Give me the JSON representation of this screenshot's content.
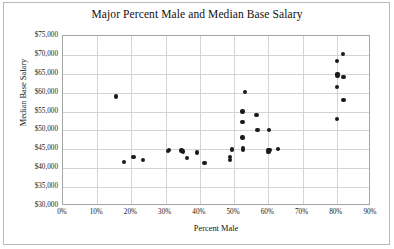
{
  "chart_data": {
    "type": "scatter",
    "title": "Major Percent Male and Median Base Salary",
    "xlabel": "Percent Male",
    "ylabel": "Median Base Salary",
    "xlim": [
      0,
      90
    ],
    "ylim": [
      30000,
      75000
    ],
    "xticks": [
      "0%",
      "10%",
      "20%",
      "30%",
      "40%",
      "50%",
      "60%",
      "70%",
      "80%",
      "90%"
    ],
    "xtick_values": [
      0,
      10,
      20,
      30,
      40,
      50,
      60,
      70,
      80,
      90
    ],
    "yticks": [
      "$30,000",
      "$35,000",
      "$40,000",
      "$45,000",
      "$50,000",
      "$55,000",
      "$60,000",
      "$65,000",
      "$70,000",
      "$75,000"
    ],
    "ytick_values": [
      30000,
      35000,
      40000,
      45000,
      50000,
      55000,
      60000,
      65000,
      70000,
      75000
    ],
    "grid": true,
    "legend": false,
    "marker_color": "#1a1a1a",
    "points": [
      {
        "x": 15.5,
        "y": 59000
      },
      {
        "x": 17.8,
        "y": 41700
      },
      {
        "x": 20.6,
        "y": 43000
      },
      {
        "x": 23.3,
        "y": 42200
      },
      {
        "x": 30.6,
        "y": 44500
      },
      {
        "x": 31.0,
        "y": 44900
      },
      {
        "x": 34.6,
        "y": 44700
      },
      {
        "x": 35.0,
        "y": 44400
      },
      {
        "x": 36.2,
        "y": 42700
      },
      {
        "x": 39.1,
        "y": 44200
      },
      {
        "x": 41.3,
        "y": 41400
      },
      {
        "x": 48.8,
        "y": 42900
      },
      {
        "x": 48.8,
        "y": 42100
      },
      {
        "x": 49.3,
        "y": 45000
      },
      {
        "x": 52.4,
        "y": 55000
      },
      {
        "x": 52.4,
        "y": 52200
      },
      {
        "x": 52.4,
        "y": 48100
      },
      {
        "x": 52.6,
        "y": 45400
      },
      {
        "x": 52.6,
        "y": 44900
      },
      {
        "x": 53.2,
        "y": 60100
      },
      {
        "x": 56.5,
        "y": 54100
      },
      {
        "x": 56.8,
        "y": 50100
      },
      {
        "x": 60.2,
        "y": 50200
      },
      {
        "x": 60.0,
        "y": 44900
      },
      {
        "x": 60.0,
        "y": 44300
      },
      {
        "x": 60.3,
        "y": 44800
      },
      {
        "x": 62.8,
        "y": 45100
      },
      {
        "x": 80.0,
        "y": 68400
      },
      {
        "x": 80.2,
        "y": 65000
      },
      {
        "x": 80.2,
        "y": 64500
      },
      {
        "x": 80.0,
        "y": 61500
      },
      {
        "x": 80.0,
        "y": 53000
      },
      {
        "x": 81.8,
        "y": 70200
      },
      {
        "x": 82.0,
        "y": 64200
      },
      {
        "x": 82.0,
        "y": 58100
      }
    ]
  }
}
